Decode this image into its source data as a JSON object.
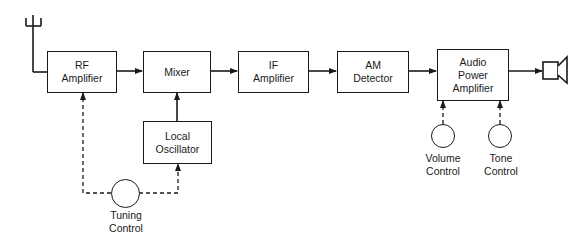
{
  "diagram": {
    "type": "block-diagram",
    "colors": {
      "line": "#1a1a1a",
      "background": "#ffffff"
    },
    "blocks": [
      {
        "id": "rf",
        "line1": "RF",
        "line2": "Amplifier"
      },
      {
        "id": "mixer",
        "line1": "Mixer"
      },
      {
        "id": "if",
        "line1": "IF",
        "line2": "Amplifier"
      },
      {
        "id": "am",
        "line1": "AM",
        "line2": "Detector"
      },
      {
        "id": "audio",
        "line1": "Audio",
        "line2": "Power",
        "line3": "Amplifier"
      },
      {
        "id": "lo",
        "line1": "Local",
        "line2": "Oscillator"
      }
    ],
    "controls": [
      {
        "id": "tuning",
        "line1": "Tuning",
        "line2": "Control"
      },
      {
        "id": "volume",
        "line1": "Volume",
        "line2": "Control"
      },
      {
        "id": "tone",
        "line1": "Tone",
        "line2": "Control"
      }
    ],
    "icons": {
      "input": "antenna-icon",
      "output": "speaker-icon"
    },
    "connections": [
      {
        "from": "antenna",
        "to": "rf",
        "style": "solid"
      },
      {
        "from": "rf",
        "to": "mixer",
        "style": "solid-arrow"
      },
      {
        "from": "lo",
        "to": "mixer",
        "style": "solid-arrow"
      },
      {
        "from": "mixer",
        "to": "if",
        "style": "solid-arrow"
      },
      {
        "from": "if",
        "to": "am",
        "style": "solid-arrow"
      },
      {
        "from": "am",
        "to": "audio",
        "style": "solid-arrow"
      },
      {
        "from": "audio",
        "to": "speaker",
        "style": "solid-arrow"
      },
      {
        "from": "tuning",
        "to": "rf",
        "style": "dashed-arrow"
      },
      {
        "from": "tuning",
        "to": "lo",
        "style": "dashed-arrow"
      },
      {
        "from": "volume",
        "to": "audio",
        "style": "dashed-arrow"
      },
      {
        "from": "tone",
        "to": "audio",
        "style": "dashed-arrow"
      }
    ]
  }
}
